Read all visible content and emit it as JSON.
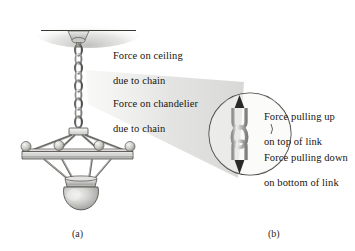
{
  "figure": {
    "panels": [
      {
        "id": "a",
        "label": "(a)",
        "description": "chandelier suspended from ceiling by chain"
      },
      {
        "id": "b",
        "label": "(b)",
        "description": "magnified view of a single chain link"
      }
    ]
  },
  "annotations": {
    "force_on_ceiling": {
      "line1": "Force on ceiling",
      "line2": "due to chain"
    },
    "force_on_chandelier": {
      "line1": "Force on chandelier",
      "line2": "due to chain"
    },
    "force_pulling_up": {
      "line1": "Force pulling up",
      "line2": "on top of link"
    },
    "force_pulling_down": {
      "line1": "Force pulling down",
      "line2": "on bottom of link"
    }
  },
  "colors": {
    "outline": "#3b3834",
    "metal_light": "#e9e9e7",
    "metal_mid": "#b9b9b6",
    "metal_dark": "#8d8d8a",
    "shadow": "#d3d3d1",
    "cone": "#dcdcda",
    "text": "#17140f",
    "background": "#ffffff"
  }
}
